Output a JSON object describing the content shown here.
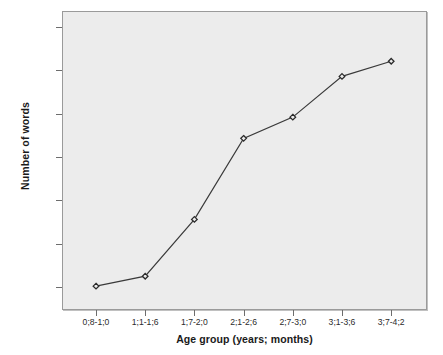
{
  "chart_data": {
    "type": "line",
    "title": "",
    "xlabel": "Age group (years; months)",
    "ylabel": "Number of words",
    "categories": [
      "0;8-1;0",
      "1;1-1;6",
      "1;7-2;0",
      "2;1-2;6",
      "2;7-3;0",
      "3;1-3;6",
      "3;7-4;2"
    ],
    "values": [
      2,
      25,
      156,
      343,
      392,
      486,
      521
    ],
    "series": [
      {
        "name": "Number of words",
        "values": [
          2,
          25,
          156,
          343,
          392,
          486,
          521
        ]
      }
    ],
    "ylim": [
      0,
      630
    ],
    "ytick_values": [
      0,
      100,
      200,
      300,
      400,
      500,
      600
    ],
    "ytick_labels": [
      ",00",
      "100,00",
      "200,00",
      "300,00",
      "400,00",
      "500,00",
      "600,00"
    ],
    "grid": false,
    "legend": "none",
    "marker": "diamond-open",
    "line_color": "#3a3a3a",
    "marker_color": "#2a2a2a",
    "plot_background": "#ececec",
    "figure_background": "#ffffff"
  },
  "axes": {
    "y_title": "Number of words",
    "x_title": "Age group (years; months)"
  }
}
